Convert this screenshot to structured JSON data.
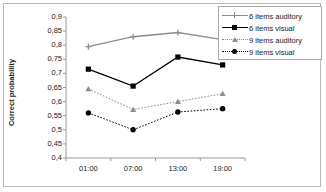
{
  "chart_data": {
    "type": "line",
    "title": "",
    "xlabel": "",
    "ylabel": "Correct probability",
    "categories": [
      "01:00",
      "07:00",
      "13:00",
      "19:00"
    ],
    "ylim": [
      0.4,
      0.9
    ],
    "yticks": [
      "0,9",
      "0,85",
      "0,8",
      "0,75",
      "0,7",
      "0,65",
      "0,6",
      "0,55",
      "0,5",
      "0,45",
      "0,4"
    ],
    "ytick_values": [
      0.9,
      0.85,
      0.8,
      0.75,
      0.7,
      0.65,
      0.6,
      0.55,
      0.5,
      0.45,
      0.4
    ],
    "grid": false,
    "legend_position": "right-top",
    "series": [
      {
        "name": "6 items auditory",
        "values": [
          0.795,
          0.83,
          0.845,
          0.82
        ],
        "color": "#8d8d8d",
        "line_style": "solid",
        "marker": "star"
      },
      {
        "name": "6 items visual",
        "values": [
          0.715,
          0.655,
          0.758,
          0.73
        ],
        "color": "#000000",
        "line_style": "solid",
        "marker": "square"
      },
      {
        "name": "9 items auditory",
        "values": [
          0.645,
          0.572,
          0.6,
          0.628
        ],
        "color": "#8d8d8d",
        "line_style": "dotted",
        "marker": "triangle"
      },
      {
        "name": "9 items visual",
        "values": [
          0.56,
          0.5,
          0.563,
          0.575
        ],
        "color": "#000000",
        "line_style": "dotted",
        "marker": "circle"
      }
    ]
  },
  "axis": {
    "y_title": "Correct probability"
  },
  "legend": {
    "items": [
      {
        "label": "6 items auditory"
      },
      {
        "label": "6 items visual"
      },
      {
        "label": "9 items auditory"
      },
      {
        "label": "9 items visual"
      }
    ]
  }
}
